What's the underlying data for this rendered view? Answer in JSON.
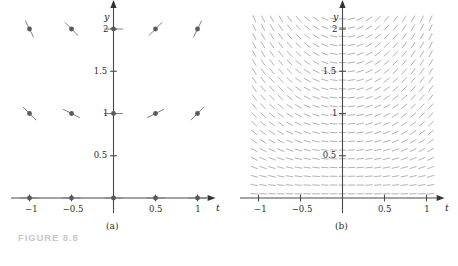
{
  "figure": {
    "caption": "FIGURE 8.8",
    "caption_color": "#c8c8cc",
    "width": 458,
    "height": 266,
    "background": "#ffffff"
  },
  "panels": [
    {
      "id": "a",
      "caption": "(a)",
      "kind": "slope-marks-at-sample-points",
      "axis": {
        "xlabel": "t",
        "ylabel": "y",
        "xticks": [
          -1,
          -0.5,
          0.5,
          1
        ],
        "xtick_labels": [
          "−1",
          "−0.5",
          "0.5",
          "1"
        ],
        "yticks": [
          0.5,
          1,
          1.5,
          2
        ],
        "ytick_labels": [
          "0.5",
          "1",
          "1.5",
          "2"
        ],
        "xlim": [
          -1.22,
          1.18
        ],
        "ylim": [
          -0.18,
          2.32
        ],
        "grid": false
      },
      "marks": {
        "sample_t": [
          -1,
          -0.5,
          0,
          0.5,
          1
        ],
        "sample_y": [
          0,
          1,
          2
        ],
        "slope_rule": "dy/dt = t*y",
        "dot_color": "#58585e",
        "line_color": "#7b7b80",
        "items": [
          {
            "t": -1,
            "y": 0,
            "slope": 0
          },
          {
            "t": -0.5,
            "y": 0,
            "slope": 0
          },
          {
            "t": 0,
            "y": 0,
            "slope": 0
          },
          {
            "t": 0.5,
            "y": 0,
            "slope": 0
          },
          {
            "t": 1,
            "y": 0,
            "slope": 0
          },
          {
            "t": -1,
            "y": 1,
            "slope": -1
          },
          {
            "t": -0.5,
            "y": 1,
            "slope": -0.5
          },
          {
            "t": 0,
            "y": 1,
            "slope": 0
          },
          {
            "t": 0.5,
            "y": 1,
            "slope": 0.5
          },
          {
            "t": 1,
            "y": 1,
            "slope": 1
          },
          {
            "t": -1,
            "y": 2,
            "slope": -2
          },
          {
            "t": -0.5,
            "y": 2,
            "slope": -1
          },
          {
            "t": 0,
            "y": 2,
            "slope": 0
          },
          {
            "t": 0.5,
            "y": 2,
            "slope": 1
          },
          {
            "t": 1,
            "y": 2,
            "slope": 2
          }
        ]
      }
    },
    {
      "id": "b",
      "caption": "(b)",
      "kind": "direction-field",
      "axis": {
        "xlabel": "t",
        "ylabel": "y",
        "xticks": [
          -1,
          -0.5,
          0.5,
          1
        ],
        "xtick_labels": [
          "−1",
          "−0.5",
          "0.5",
          "1"
        ],
        "yticks": [
          0.5,
          1,
          1.5,
          2
        ],
        "ytick_labels": [
          "0.5",
          "1",
          "1.5",
          "2"
        ],
        "xlim": [
          -1.22,
          1.18
        ],
        "ylim": [
          -0.18,
          2.32
        ],
        "grid": false
      },
      "field": {
        "slope_rule": "dy/dt = t*y",
        "t_min": -1.05,
        "t_max": 1.05,
        "y_min": 0.05,
        "y_max": 2.12,
        "cols": 21,
        "rows": 21,
        "line_color": "#a9a9b0",
        "segment_length": 7.5
      }
    }
  ],
  "chart_data": [
    {
      "type": "scatter",
      "title": "(a)",
      "xlabel": "t",
      "ylabel": "y",
      "xlim": [
        -1.22,
        1.18
      ],
      "ylim": [
        -0.18,
        2.32
      ],
      "xticks": [
        -1,
        -0.5,
        0.5,
        1
      ],
      "yticks": [
        0.5,
        1,
        1.5,
        2
      ],
      "grid": false,
      "legend": null,
      "annotations": [
        "short tangent segment drawn through each sample point with slope t*y"
      ],
      "points": [
        {
          "x": -1,
          "y": 0,
          "slope": 0
        },
        {
          "x": -0.5,
          "y": 0,
          "slope": 0
        },
        {
          "x": 0,
          "y": 0,
          "slope": 0
        },
        {
          "x": 0.5,
          "y": 0,
          "slope": 0
        },
        {
          "x": 1,
          "y": 0,
          "slope": 0
        },
        {
          "x": -1,
          "y": 1,
          "slope": -1
        },
        {
          "x": -0.5,
          "y": 1,
          "slope": -0.5
        },
        {
          "x": 0,
          "y": 1,
          "slope": 0
        },
        {
          "x": 0.5,
          "y": 1,
          "slope": 0.5
        },
        {
          "x": 1,
          "y": 1,
          "slope": 1
        },
        {
          "x": -1,
          "y": 2,
          "slope": -2
        },
        {
          "x": -0.5,
          "y": 2,
          "slope": -1
        },
        {
          "x": 0,
          "y": 2,
          "slope": 0
        },
        {
          "x": 0.5,
          "y": 2,
          "slope": 1
        },
        {
          "x": 1,
          "y": 2,
          "slope": 2
        }
      ]
    },
    {
      "type": "scatter",
      "title": "(b)",
      "xlabel": "t",
      "ylabel": "y",
      "xlim": [
        -1.22,
        1.18
      ],
      "ylim": [
        -0.18,
        2.32
      ],
      "xticks": [
        -1,
        -0.5,
        0.5,
        1
      ],
      "yticks": [
        0.5,
        1,
        1.5,
        2
      ],
      "grid": false,
      "legend": null,
      "annotations": [
        "direction field of dy/dt = t*y on a 21 x 21 lattice over -1 <= t <= 1, 0 <= y <= 2"
      ],
      "points": []
    }
  ]
}
